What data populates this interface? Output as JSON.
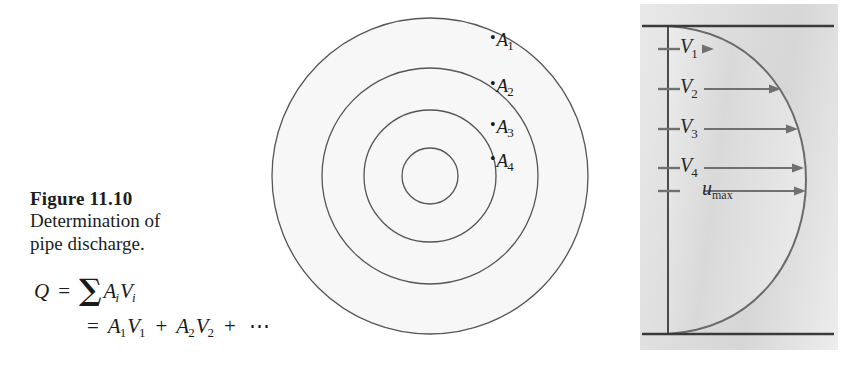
{
  "figure": {
    "number_label": "Figure 11.10",
    "caption_lines": [
      "Determination of",
      "pipe discharge."
    ],
    "equations": {
      "line1": {
        "lhs": "Q",
        "equals": "=",
        "sum_symbol": "∑",
        "term_area": "A",
        "term_area_sub": "i",
        "term_velocity": "V",
        "term_velocity_sub": "i"
      },
      "line2": {
        "equals": "=",
        "t1_area": "A",
        "t1_area_sub": "1",
        "t1_vel": "V",
        "t1_vel_sub": "1",
        "plus1": "+",
        "t2_area": "A",
        "t2_area_sub": "2",
        "t2_vel": "V",
        "t2_vel_sub": "2",
        "plus2": "+",
        "ellipsis": "⋯"
      }
    }
  },
  "circles": {
    "title": "concentric pipe cross-section areas",
    "center_x": 162,
    "center_y": 176,
    "radii": [
      158,
      108,
      66,
      28
    ],
    "stroke_color": "#555555",
    "fill_color": "#f7f7f7",
    "labels": [
      {
        "name": "A",
        "index": "1",
        "dot": "•",
        "x": 222,
        "y": 29
      },
      {
        "name": "A",
        "index": "2",
        "dot": "•",
        "x": 222,
        "y": 75
      },
      {
        "name": "A",
        "index": "3",
        "dot": "•",
        "x": 222,
        "y": 116
      },
      {
        "name": "A",
        "index": "4",
        "dot": "•",
        "x": 222,
        "y": 150
      }
    ]
  },
  "velocity_profile": {
    "panel_background": "#dedede",
    "wall_color": "#3a3a3a",
    "curve_color": "#6a6a6a",
    "arrow_color": "#707070",
    "top_wall_y": 22,
    "bottom_wall_y": 330,
    "axis_x": 28,
    "max_curve_x": 166,
    "arrows": [
      {
        "label": "V",
        "sub": "1",
        "y": 45,
        "tip_x": 74,
        "label_x": 40,
        "label_y": 31
      },
      {
        "label": "V",
        "sub": "2",
        "y": 85,
        "tip_x": 141,
        "label_x": 40,
        "label_y": 71
      },
      {
        "label": "V",
        "sub": "3",
        "y": 125,
        "tip_x": 158,
        "label_x": 40,
        "label_y": 111
      },
      {
        "label": "V",
        "sub": "4",
        "y": 164,
        "tip_x": 164,
        "label_x": 40,
        "label_y": 150
      },
      {
        "label": "u",
        "sub": "max",
        "y": 187,
        "tip_x": 166,
        "label_x": 62,
        "label_y": 173
      }
    ]
  }
}
